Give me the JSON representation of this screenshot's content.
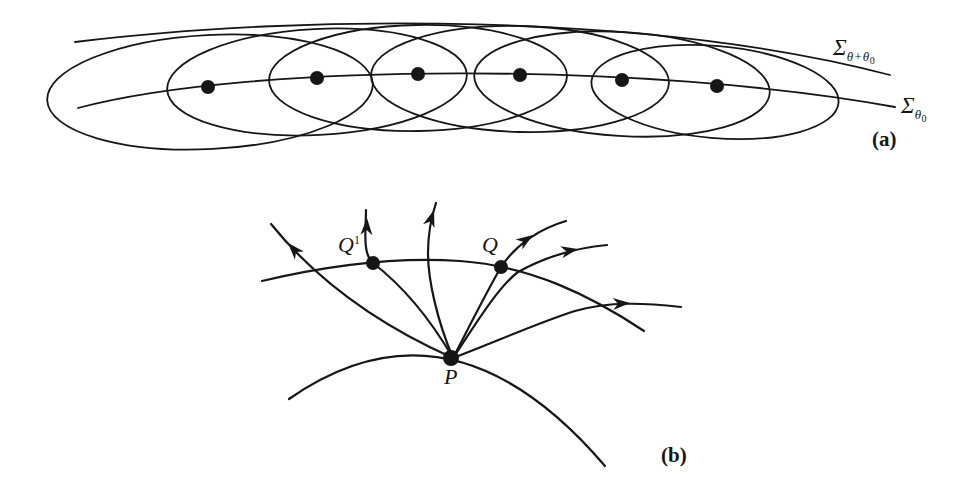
{
  "figure": {
    "background": "#ffffff",
    "ink": "#161616"
  },
  "panel_a": {
    "tag": "(a)",
    "sigma_upper": {
      "base": "Σ",
      "sub": "θ+θ",
      "subsub": "0"
    },
    "sigma_lower": {
      "base": "Σ",
      "sub": "θ",
      "subsub": "0"
    },
    "curves": [
      {
        "name": "sigma-upper-curve",
        "d": "M75,42 C300,14 650,12 890,75"
      },
      {
        "name": "sigma-lower-curve",
        "d": "M78,108 C250,62 650,62 895,107"
      }
    ],
    "ellipses": [
      {
        "cx": 210,
        "cy": 92,
        "rx": 163,
        "ry": 57,
        "rot": -3
      },
      {
        "cx": 317,
        "cy": 82,
        "rx": 150,
        "ry": 53,
        "rot": -3
      },
      {
        "cx": 418,
        "cy": 78,
        "rx": 149,
        "ry": 53,
        "rot": -1
      },
      {
        "cx": 520,
        "cy": 79,
        "rx": 149,
        "ry": 53,
        "rot": 1.5
      },
      {
        "cx": 622,
        "cy": 84,
        "rx": 148,
        "ry": 52,
        "rot": 3.5
      },
      {
        "cx": 715,
        "cy": 92,
        "rx": 124,
        "ry": 46,
        "rot": 5
      }
    ],
    "dots": [
      {
        "x": 208,
        "y": 87
      },
      {
        "x": 317,
        "y": 78
      },
      {
        "x": 418,
        "y": 74
      },
      {
        "x": 520,
        "y": 75
      },
      {
        "x": 622,
        "y": 80
      },
      {
        "x": 717,
        "y": 86
      }
    ],
    "dot_radius": 7
  },
  "panel_b": {
    "tag": "(b)",
    "point_labels": {
      "P": "P",
      "Q": "Q",
      "Q1_base": "Q",
      "Q1_sup": "1"
    },
    "curves": [
      {
        "name": "base-curve-through-p",
        "d": "M289,399 Q451,286 605,466"
      },
      {
        "name": "arc-through-q1-q",
        "d": "M262,281 C330,265 400,257 460,261 C530,266 590,295 644,331"
      },
      {
        "name": "geodesic-up-left",
        "d": "M453,358 C390,330 322,287 271,224"
      },
      {
        "name": "geodesic-through-q1",
        "d": "M453,358 C425,310 395,280 373,263 C362,254 366,228 366,210"
      },
      {
        "name": "geodesic-up-middle",
        "d": "M453,358 C437,320 428,280 428,253 C428,235 431,218 436,203"
      },
      {
        "name": "geodesic-through-q",
        "d": "M453,358 C470,325 485,295 501,267 C517,243 542,228 566,221"
      },
      {
        "name": "geodesic-right-upper",
        "d": "M453,358 C475,325 498,287 518,272 C545,257 575,248 607,245"
      },
      {
        "name": "geodesic-right-lower",
        "d": "M453,358 C500,340 540,322 575,311 C610,301 645,303 681,307"
      }
    ],
    "arrows": [
      {
        "name": "arrow-up-left",
        "x": 288,
        "y": 243,
        "angle": 228
      },
      {
        "name": "arrow-q1-geodesic",
        "x": 367,
        "y": 218,
        "angle": -88
      },
      {
        "name": "arrow-middle-geodesic",
        "x": 434,
        "y": 210,
        "angle": -72
      },
      {
        "name": "arrow-q-geodesic",
        "x": 533,
        "y": 235,
        "angle": -34
      },
      {
        "name": "arrow-right-upper",
        "x": 578,
        "y": 249,
        "angle": -11
      },
      {
        "name": "arrow-right-lower",
        "x": 630,
        "y": 303,
        "angle": -3
      }
    ],
    "dots": [
      {
        "name": "point-p-dot",
        "x": 451,
        "y": 358,
        "r": 8
      },
      {
        "name": "point-q1-dot",
        "x": 373,
        "y": 263,
        "r": 7
      },
      {
        "name": "point-q-dot",
        "x": 501,
        "y": 267,
        "r": 7
      }
    ]
  }
}
